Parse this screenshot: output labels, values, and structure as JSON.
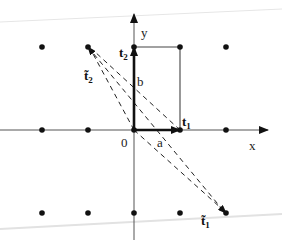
{
  "diagram": {
    "type": "lattice-basis-reduction",
    "axes": {
      "x_label": "x",
      "y_label": "y",
      "origin_label": "0"
    },
    "vectors": {
      "a": {
        "label": "a",
        "from": [
          0,
          0
        ],
        "to": [
          1,
          0
        ],
        "style": "bold-arrow"
      },
      "b": {
        "label": "b",
        "from": [
          0,
          0
        ],
        "to": [
          0,
          1
        ],
        "style": "bold-arrow"
      },
      "t1": {
        "label": "t",
        "subscript": "1"
      },
      "t2": {
        "label": "t",
        "subscript": "2"
      },
      "t1_tilde": {
        "label": "t̃",
        "subscript": "1",
        "from": [
          0,
          0
        ],
        "to": [
          2,
          -1
        ],
        "style": "dashed-arrow"
      },
      "t2_tilde": {
        "label": "t̃",
        "subscript": "2",
        "from": [
          0,
          0
        ],
        "to": [
          -1,
          1
        ],
        "style": "dashed-arrow"
      }
    },
    "rectangle": {
      "corners": [
        [
          0,
          0
        ],
        [
          1,
          0
        ],
        [
          1,
          1
        ],
        [
          0,
          1
        ]
      ]
    },
    "lattice_points": [
      [
        -2,
        1
      ],
      [
        -1,
        1
      ],
      [
        0,
        1
      ],
      [
        1,
        1
      ],
      [
        2,
        1
      ],
      [
        -2,
        0
      ],
      [
        -1,
        0
      ],
      [
        0,
        0
      ],
      [
        1,
        0
      ],
      [
        2,
        0
      ],
      [
        -2,
        -1
      ],
      [
        -1,
        -1
      ],
      [
        0,
        -1
      ],
      [
        1,
        -1
      ],
      [
        2,
        -1
      ]
    ],
    "colors": {
      "ink": "#111111",
      "axis": "#444444",
      "scan_line": "#e6e6e6"
    }
  }
}
